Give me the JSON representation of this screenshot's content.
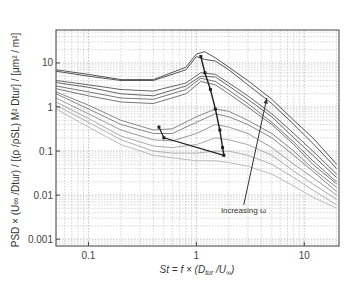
{
  "chart_data": {
    "type": "line",
    "title": "",
    "xlabel": "St = f × (D_tur / U_∞)",
    "ylabel": "PSD × (U_∞ / D_tur) / [(ρ / ρSL) M² D_tur] / [μm² / m²]",
    "xscale": "log",
    "yscale": "log",
    "xlim": [
      0.05,
      21
    ],
    "ylim": [
      0.0007,
      56
    ],
    "grid": true,
    "x_ticks": [
      {
        "v": 0.1,
        "label": "0.1"
      },
      {
        "v": 1,
        "label": "1"
      },
      {
        "v": 10,
        "label": "10"
      }
    ],
    "y_ticks": [
      {
        "v": 10,
        "label": "10"
      },
      {
        "v": 1,
        "label": "1"
      },
      {
        "v": 0.1,
        "label": "0.1"
      },
      {
        "v": 0.01,
        "label": "0.01"
      },
      {
        "v": 0.001,
        "label": "0.001"
      }
    ],
    "annotation": {
      "text": "increasing ω",
      "x": 1.7,
      "y": 0.004,
      "arrow_from": [
        2.75,
        0.006
      ],
      "arrow_to": [
        4.5,
        1.6
      ]
    },
    "series": [
      {
        "name": "s1",
        "color": "#555555",
        "x": [
          0.05,
          0.1,
          0.2,
          0.4,
          0.8,
          1.0,
          1.2,
          1.5,
          2,
          3,
          5,
          8,
          12,
          20
        ],
        "y": [
          7,
          5.5,
          4.2,
          4.2,
          8,
          16,
          18,
          13,
          8,
          4,
          1.5,
          0.5,
          0.2,
          0.05
        ]
      },
      {
        "name": "s2",
        "color": "#555555",
        "x": [
          0.05,
          0.1,
          0.2,
          0.4,
          0.8,
          1.0,
          1.2,
          1.5,
          2,
          3,
          5,
          8,
          12,
          20
        ],
        "y": [
          6.5,
          5,
          4,
          4,
          7,
          14,
          12,
          11,
          7,
          3.2,
          1.2,
          0.4,
          0.15,
          0.04
        ]
      },
      {
        "name": "s3",
        "color": "#666666",
        "x": [
          0.05,
          0.1,
          0.2,
          0.4,
          0.8,
          1.1,
          1.5,
          2,
          3,
          5,
          8,
          12,
          20
        ],
        "y": [
          4,
          3.2,
          2.5,
          2.3,
          3.5,
          6,
          5.5,
          3.5,
          1.8,
          0.7,
          0.25,
          0.1,
          0.03
        ]
      },
      {
        "name": "s4",
        "color": "#666666",
        "x": [
          0.05,
          0.1,
          0.2,
          0.4,
          0.8,
          1.1,
          1.5,
          2,
          3,
          5,
          8,
          12,
          20
        ],
        "y": [
          3.6,
          2.8,
          2,
          1.8,
          3,
          5,
          4.8,
          3.0,
          1.5,
          0.6,
          0.2,
          0.08,
          0.025
        ]
      },
      {
        "name": "s5",
        "color": "#777777",
        "x": [
          0.05,
          0.1,
          0.2,
          0.4,
          0.8,
          1.1,
          1.5,
          2,
          3,
          5,
          8,
          12,
          20
        ],
        "y": [
          3,
          2.2,
          1.6,
          1.5,
          2.5,
          4.5,
          3.8,
          2.4,
          1.2,
          0.45,
          0.16,
          0.06,
          0.02
        ]
      },
      {
        "name": "s6",
        "color": "#777777",
        "x": [
          0.05,
          0.1,
          0.2,
          0.4,
          0.8,
          1.1,
          1.5,
          2,
          3,
          5,
          8,
          12,
          20
        ],
        "y": [
          2.6,
          1.8,
          1.3,
          1.2,
          2,
          3.8,
          3.2,
          2,
          1,
          0.4,
          0.14,
          0.05,
          0.018
        ]
      },
      {
        "name": "s7",
        "color": "#888888",
        "x": [
          0.05,
          0.1,
          0.2,
          0.4,
          0.6,
          1.0,
          1.5,
          2,
          3,
          5,
          8,
          12,
          20
        ],
        "y": [
          2.2,
          1.1,
          0.5,
          0.3,
          0.32,
          0.6,
          0.9,
          0.8,
          0.5,
          0.25,
          0.1,
          0.04,
          0.015
        ]
      },
      {
        "name": "s8",
        "color": "#888888",
        "x": [
          0.05,
          0.1,
          0.2,
          0.4,
          0.6,
          1.0,
          1.5,
          2,
          3,
          5,
          8,
          12,
          20
        ],
        "y": [
          2.0,
          0.9,
          0.4,
          0.25,
          0.25,
          0.45,
          0.7,
          0.6,
          0.4,
          0.2,
          0.08,
          0.035,
          0.012
        ]
      },
      {
        "name": "s9",
        "color": "#999999",
        "x": [
          0.05,
          0.1,
          0.2,
          0.4,
          0.6,
          1.0,
          1.5,
          2,
          3,
          5,
          8,
          12,
          20
        ],
        "y": [
          1.6,
          0.7,
          0.3,
          0.18,
          0.17,
          0.25,
          0.4,
          0.35,
          0.25,
          0.12,
          0.05,
          0.025,
          0.01
        ]
      },
      {
        "name": "s10",
        "color": "#aaaaaa",
        "x": [
          0.05,
          0.1,
          0.2,
          0.4,
          0.6,
          1.0,
          1.5,
          2,
          3,
          5,
          8,
          12,
          20
        ],
        "y": [
          1.3,
          0.55,
          0.22,
          0.13,
          0.12,
          0.14,
          0.2,
          0.18,
          0.14,
          0.08,
          0.035,
          0.018,
          0.008
        ]
      },
      {
        "name": "s11",
        "color": "#b0b0b0",
        "x": [
          0.05,
          0.1,
          0.2,
          0.4,
          0.6,
          1.0,
          1.5,
          2,
          3,
          5,
          8,
          12,
          20
        ],
        "y": [
          1.1,
          0.45,
          0.18,
          0.1,
          0.09,
          0.09,
          0.1,
          0.1,
          0.08,
          0.05,
          0.025,
          0.013,
          0.006
        ]
      },
      {
        "name": "s12",
        "color": "#bbbbbb",
        "x": [
          0.05,
          0.1,
          0.2,
          0.4,
          0.6,
          1.0,
          1.5,
          2,
          3,
          5,
          8,
          12,
          20
        ],
        "y": [
          0.9,
          0.35,
          0.14,
          0.08,
          0.07,
          0.06,
          0.06,
          0.055,
          0.045,
          0.03,
          0.016,
          0.009,
          0.005
        ]
      }
    ],
    "trace_markers": {
      "color": "#222222",
      "x": [
        1.1,
        1.2,
        1.35,
        1.5,
        1.65,
        1.75,
        1.8,
        0.5,
        0.45
      ],
      "y": [
        14,
        6,
        2.5,
        0.9,
        0.3,
        0.12,
        0.08,
        0.2,
        0.35
      ]
    }
  }
}
